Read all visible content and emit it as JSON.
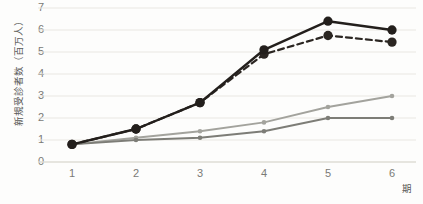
{
  "chart_data": {
    "type": "line",
    "title": "",
    "xlabel": "期",
    "ylabel": "新規受診者数（百万人）",
    "categories": [
      "1",
      "2",
      "3",
      "4",
      "5",
      "6"
    ],
    "x": [
      1,
      2,
      3,
      4,
      5,
      6
    ],
    "xlim": [
      0.6,
      6.4
    ],
    "ylim": [
      0,
      7
    ],
    "yticks": [
      "0",
      "1",
      "2",
      "3",
      "4",
      "5",
      "6",
      "7"
    ],
    "ytick_values": [
      0,
      1,
      2,
      3,
      4,
      5,
      6,
      7
    ],
    "grid": "horizontal",
    "legend": "none",
    "series": [
      {
        "name": "series-1-solid-black",
        "values": [
          0.8,
          1.5,
          2.7,
          5.1,
          6.4,
          6.0
        ],
        "color": "#231f1c",
        "style": "solid",
        "width": 2.4,
        "marker": "circle",
        "marker_size": 6.5
      },
      {
        "name": "series-2-dashed-black",
        "values": [
          0.8,
          1.5,
          2.7,
          4.9,
          5.75,
          5.45
        ],
        "color": "#2b2622",
        "style": "dashed",
        "width": 2.2,
        "marker": "circle",
        "marker_size": 6.5
      },
      {
        "name": "series-3-light-gray",
        "values": [
          0.8,
          1.1,
          1.4,
          1.8,
          2.5,
          3.0
        ],
        "color": "#a3a39d",
        "style": "solid",
        "width": 1.9,
        "marker": "circle",
        "marker_size": 3.4
      },
      {
        "name": "series-4-medium-gray",
        "values": [
          0.8,
          1.0,
          1.1,
          1.4,
          2.0,
          2.0
        ],
        "color": "#7d7d77",
        "style": "solid",
        "width": 1.9,
        "marker": "circle",
        "marker_size": 3.4
      }
    ],
    "colors": {
      "grid": "#e9e7e2",
      "baseline": "#dedcd6",
      "tick_text": "#7a7a76",
      "axis_title": "#5a5a58",
      "background": "#fdfdfc"
    }
  }
}
